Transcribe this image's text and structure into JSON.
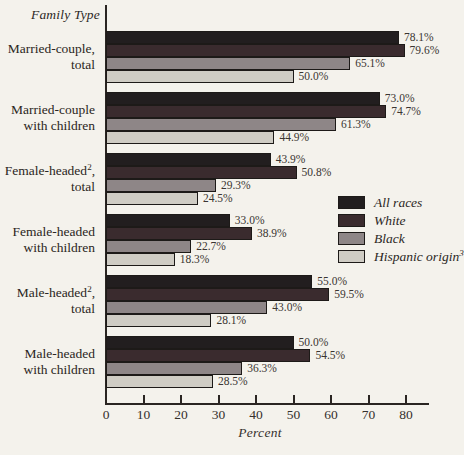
{
  "chart_data": {
    "type": "bar",
    "orientation": "horizontal",
    "corner_label": "Family Type",
    "xlabel": "Percent",
    "xlim": [
      0,
      80
    ],
    "x_ticks": [
      0,
      10,
      20,
      30,
      40,
      50,
      60,
      70,
      80
    ],
    "grid": false,
    "legend_position": "middle-right",
    "value_label_format": "one-decimal-percent",
    "categories": [
      {
        "lines": [
          "Married-couple,",
          "total"
        ]
      },
      {
        "lines": [
          "Married-couple",
          "with children"
        ]
      },
      {
        "lines": [
          "Female-headed^2,",
          "total"
        ]
      },
      {
        "lines": [
          "Female-headed",
          "with children"
        ]
      },
      {
        "lines": [
          "Male-headed^2,",
          "total"
        ]
      },
      {
        "lines": [
          "Male-headed",
          "with children"
        ]
      }
    ],
    "series": [
      {
        "name": "All races",
        "color": "#221e1f",
        "values": [
          78.1,
          73.0,
          43.9,
          33.0,
          55.0,
          50.0
        ]
      },
      {
        "name": "White",
        "color": "#3a2b2e",
        "values": [
          79.6,
          74.7,
          50.8,
          38.9,
          59.5,
          54.5
        ]
      },
      {
        "name": "Black",
        "color": "#8e8687",
        "values": [
          65.1,
          61.3,
          29.3,
          22.7,
          43.0,
          36.3
        ]
      },
      {
        "name": "Hispanic origin^3",
        "color": "#cfccc4",
        "values": [
          50.0,
          44.9,
          24.5,
          18.3,
          28.1,
          28.5
        ]
      }
    ]
  }
}
